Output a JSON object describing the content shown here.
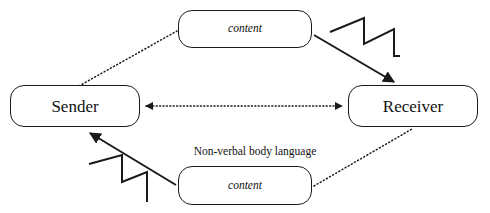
{
  "diagram": {
    "background_color": "#ffffff",
    "stroke_color": "#1a1a1a",
    "text_color": "#111111",
    "width": 490,
    "height": 213,
    "nodes": [
      {
        "id": "sender",
        "label": "Sender",
        "style": "rounded-rect",
        "text_style": "normal"
      },
      {
        "id": "receiver",
        "label": "Receiver",
        "style": "rounded-rect",
        "text_style": "normal"
      },
      {
        "id": "content_top",
        "label": "content",
        "style": "rounded-rect",
        "text_style": "italic"
      },
      {
        "id": "content_bottom",
        "label": "content",
        "style": "rounded-rect",
        "text_style": "italic"
      }
    ],
    "edges": [
      {
        "id": "sender-to-content-top",
        "from": "sender",
        "to": "content_top",
        "line": "dotted",
        "arrow": "none"
      },
      {
        "id": "content-top-to-receiver",
        "from": "content_top",
        "to": "receiver",
        "line": "solid",
        "arrow": "single",
        "noise": true
      },
      {
        "id": "sender-receiver-bidirection",
        "from": "sender",
        "to": "receiver",
        "line": "dotted",
        "arrow": "double"
      },
      {
        "id": "content-bottom-to-sender",
        "from": "content_bottom",
        "to": "sender",
        "line": "solid",
        "arrow": "single",
        "noise": true
      },
      {
        "id": "receiver-to-content-bottom",
        "from": "receiver",
        "to": "content_bottom",
        "line": "dotted",
        "arrow": "none"
      }
    ],
    "edge_labels": [
      {
        "id": "nonverbal",
        "text": "Non-verbal body language"
      }
    ],
    "annotations": {
      "noise_symbol_name": "zigzag-noise-icon",
      "noise_symbol_count": 2
    }
  }
}
